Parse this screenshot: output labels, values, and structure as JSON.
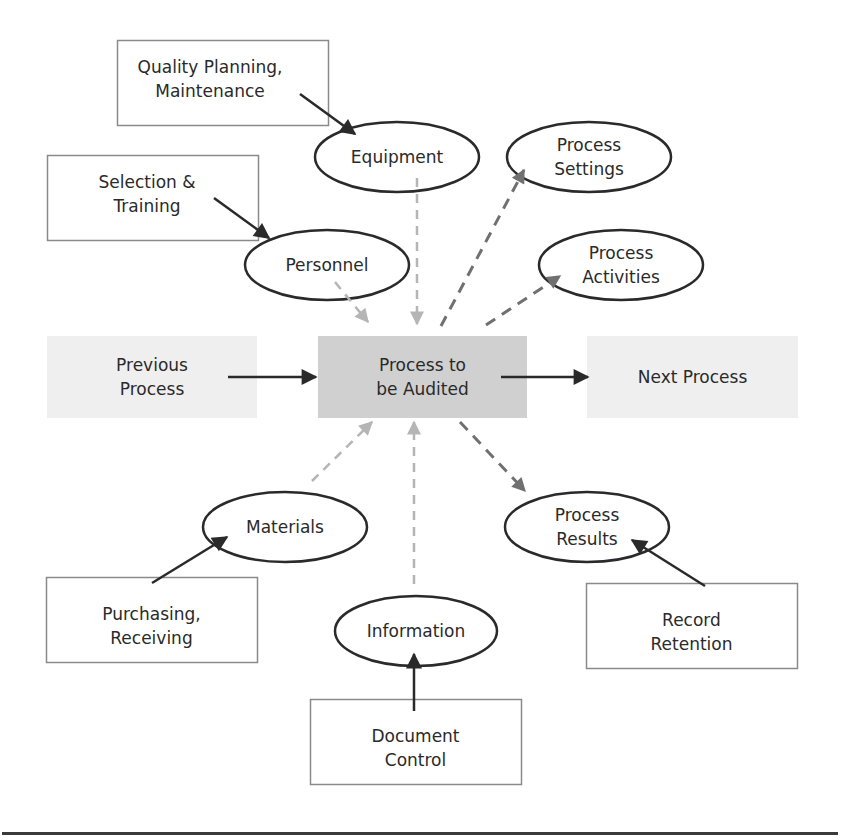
{
  "colors": {
    "stroke": "#2a2a2a",
    "box_border": "#8a8a8a",
    "center_fill": "#d0d0d0",
    "side_fill": "#efefef",
    "incoming_arrow": "#b5b5b5",
    "outgoing_arrow": "#707070",
    "feeder_arrow": "#2a2a2a"
  },
  "center": {
    "id": "process-to-be-audited",
    "label": "Process to\nbe Audited"
  },
  "flow": [
    {
      "id": "previous-process",
      "label": "Previous\nProcess"
    },
    {
      "id": "next-process",
      "label": "Next Process"
    }
  ],
  "inputs": [
    {
      "id": "equipment",
      "label": "Equipment",
      "source": {
        "id": "quality-planning-maintenance",
        "label": "Quality Planning,\nMaintenance"
      }
    },
    {
      "id": "personnel",
      "label": "Personnel",
      "source": {
        "id": "selection-training",
        "label": "Selection &\nTraining"
      }
    },
    {
      "id": "materials",
      "label": "Materials",
      "source": {
        "id": "purchasing-receiving",
        "label": "Purchasing,\nReceiving"
      }
    },
    {
      "id": "information",
      "label": "Information",
      "source": {
        "id": "document-control",
        "label": "Document\nControl"
      }
    }
  ],
  "outputs": [
    {
      "id": "process-settings",
      "label": "Process\nSettings"
    },
    {
      "id": "process-activities",
      "label": "Process\nActivities"
    },
    {
      "id": "process-results",
      "label": "Process\nResults",
      "source": {
        "id": "record-retention",
        "label": "Record\nRetention"
      }
    }
  ]
}
